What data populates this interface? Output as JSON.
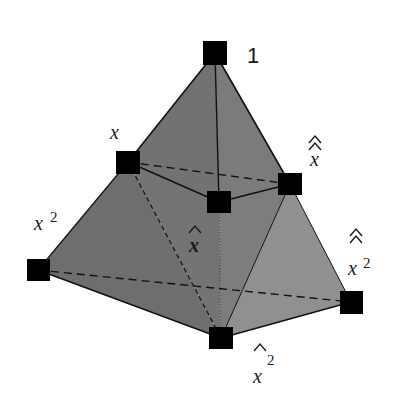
{
  "diagram": {
    "type": "polytope-lattice",
    "colors": {
      "background": "#ffffff",
      "face_top_left": "#707070",
      "face_top_right": "#7a7a7a",
      "face_front": "#767676",
      "face_left": "#6c6c6c",
      "face_right": "#8f8f8f",
      "edge": "#111111",
      "vertex": "#000000"
    },
    "vertices": [
      {
        "id": "one",
        "label": "1",
        "x": 215,
        "y": 53
      },
      {
        "id": "x",
        "label": "x",
        "x": 128,
        "y": 162
      },
      {
        "id": "xhat",
        "label": "x̂",
        "x": 219,
        "y": 202
      },
      {
        "id": "xhathat",
        "label": "x̂̂",
        "x": 290,
        "y": 184
      },
      {
        "id": "x2",
        "label": "x²",
        "x": 38,
        "y": 270
      },
      {
        "id": "xhat2",
        "label": "x̂²",
        "x": 221,
        "y": 338
      },
      {
        "id": "xhathat2",
        "label": "x̂̂²",
        "x": 351,
        "y": 302
      }
    ],
    "edges": [
      {
        "from": "one",
        "to": "x",
        "style": "solid"
      },
      {
        "from": "one",
        "to": "xhathat",
        "style": "solid"
      },
      {
        "from": "one",
        "to": "xhat",
        "style": "solid"
      },
      {
        "from": "x",
        "to": "xhat",
        "style": "solid"
      },
      {
        "from": "xhat",
        "to": "xhathat",
        "style": "solid"
      },
      {
        "from": "x",
        "to": "xhathat",
        "style": "dashed"
      },
      {
        "from": "x",
        "to": "x2",
        "style": "solid"
      },
      {
        "from": "x2",
        "to": "xhat2",
        "style": "solid"
      },
      {
        "from": "xhat2",
        "to": "xhathat2",
        "style": "solid"
      },
      {
        "from": "xhathat",
        "to": "xhathat2",
        "style": "solid"
      },
      {
        "from": "x2",
        "to": "xhathat2",
        "style": "dashed"
      },
      {
        "from": "x",
        "to": "xhat2",
        "style": "dashed"
      },
      {
        "from": "xhathat",
        "to": "xhat2",
        "style": "solid"
      },
      {
        "from": "xhat",
        "to": "xhat2",
        "style": "thin"
      }
    ],
    "labels": {
      "one": "1",
      "x": "x",
      "xhat": "x",
      "xhathat": "x",
      "x2_base": "x",
      "x2_exp": "2",
      "xhat2_base": "x",
      "xhat2_exp": "2",
      "xhathat2_base": "x",
      "xhathat2_exp": "2"
    }
  }
}
